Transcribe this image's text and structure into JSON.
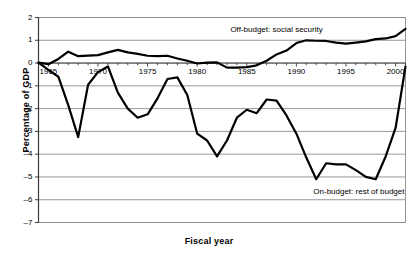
{
  "chart_data": {
    "type": "line",
    "title": "",
    "xlabel": "Fiscal year",
    "ylabel": "Percentage of GDP",
    "xlim": [
      1964,
      2001
    ],
    "ylim": [
      -7,
      2
    ],
    "grid": true,
    "grid_axis": "y",
    "legend_position": "inline-annotations",
    "y_ticks": [
      "2",
      "1",
      "0",
      "-1",
      "-2",
      "-3",
      "-4",
      "-5",
      "-6",
      "-7"
    ],
    "y_tick_values": [
      2,
      1,
      0,
      -1,
      -2,
      -3,
      -4,
      -5,
      -6,
      -7
    ],
    "x_ticks": [
      "1965",
      "1970",
      "1975",
      "1980",
      "1985",
      "1990",
      "1995",
      "2000"
    ],
    "x_tick_values": [
      1965,
      1970,
      1975,
      1980,
      1985,
      1990,
      1995,
      2000
    ],
    "x_minor_tick_interval": 1,
    "annotations": [
      {
        "name": "off-budget-label",
        "text": "Off-budget: social security",
        "x": 1988.0,
        "y": 1.45
      },
      {
        "name": "on-budget-label",
        "text": "On-budget: rest of budget",
        "x": 1996.3,
        "y": -5.65
      }
    ],
    "x": [
      1964,
      1965,
      1966,
      1967,
      1968,
      1969,
      1970,
      1971,
      1972,
      1973,
      1974,
      1975,
      1976,
      1977,
      1978,
      1979,
      1980,
      1981,
      1982,
      1983,
      1984,
      1985,
      1986,
      1987,
      1988,
      1989,
      1990,
      1991,
      1992,
      1993,
      1994,
      1995,
      1996,
      1997,
      1998,
      1999,
      2000,
      2001
    ],
    "series": [
      {
        "name": "Off-budget: social security",
        "color": "#000000",
        "width": 2.2,
        "values": [
          0.02,
          -0.05,
          0.18,
          0.5,
          0.3,
          0.33,
          0.35,
          0.47,
          0.58,
          0.47,
          0.4,
          0.32,
          0.3,
          0.32,
          0.2,
          0.1,
          -0.02,
          0.02,
          0.03,
          -0.2,
          -0.2,
          -0.18,
          -0.1,
          0.1,
          0.38,
          0.55,
          0.88,
          1.0,
          0.98,
          0.97,
          0.9,
          0.85,
          0.9,
          0.95,
          1.05,
          1.08,
          1.18,
          1.5
        ]
      },
      {
        "name": "On-budget: rest of budget",
        "color": "#000000",
        "width": 2.2,
        "values": [
          0.02,
          -0.3,
          -0.6,
          -1.85,
          -3.25,
          -0.95,
          -0.4,
          -0.15,
          -1.3,
          -2.0,
          -2.4,
          -2.25,
          -1.55,
          -0.7,
          -0.63,
          -1.4,
          -3.1,
          -3.4,
          -4.1,
          -3.4,
          -2.4,
          -2.05,
          -2.2,
          -1.6,
          -1.65,
          -2.3,
          -3.1,
          -4.15,
          -5.1,
          -4.4,
          -4.45,
          -4.45,
          -4.7,
          -5.0,
          -5.1,
          -4.1,
          -2.85,
          -0.15
        ]
      }
    ]
  },
  "axis": {
    "y_title": "Percentage of GDP",
    "x_title": "Fiscal year"
  }
}
